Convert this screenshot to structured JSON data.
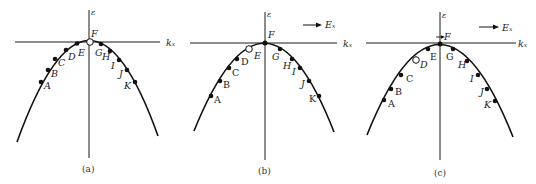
{
  "figure": {
    "panels": [
      {
        "id": "a",
        "caption": "(a)",
        "axis_y_label": "ε",
        "axis_x_label": "kₓ",
        "field_label": "",
        "empty_state": "F",
        "points": [
          {
            "label": "A",
            "x": 41,
            "y": 82,
            "filled": true
          },
          {
            "label": "B",
            "x": 48,
            "y": 70,
            "filled": true
          },
          {
            "label": "C",
            "x": 55,
            "y": 59,
            "filled": true
          },
          {
            "label": "D",
            "x": 66,
            "y": 50,
            "filled": true
          },
          {
            "label": "E",
            "x": 77,
            "y": 43.5,
            "filled": true
          },
          {
            "label": "F",
            "x": 90,
            "y": 42,
            "filled": false
          },
          {
            "label": "G",
            "x": 101,
            "y": 44,
            "filled": true
          },
          {
            "label": "H",
            "x": 110,
            "y": 51,
            "filled": true
          },
          {
            "label": "I",
            "x": 119,
            "y": 60,
            "filled": true
          },
          {
            "label": "J",
            "x": 127,
            "y": 70,
            "filled": true
          },
          {
            "label": "K",
            "x": 135,
            "y": 82,
            "filled": true
          }
        ]
      },
      {
        "id": "b",
        "caption": "(b)",
        "axis_y_label": "ε",
        "axis_x_label": "kₓ",
        "field_label": "Eₓ",
        "empty_state": "E",
        "points": [
          {
            "label": "A",
            "x": 211,
            "y": 96,
            "filled": true
          },
          {
            "label": "B",
            "x": 220,
            "y": 81,
            "filled": true
          },
          {
            "label": "C",
            "x": 229,
            "y": 68,
            "filled": true
          },
          {
            "label": "D",
            "x": 237,
            "y": 59,
            "filled": true
          },
          {
            "label": "E",
            "x": 249,
            "y": 49,
            "filled": false
          },
          {
            "label": "F",
            "x": 265,
            "y": 43,
            "filled": true
          },
          {
            "label": "G",
            "x": 280,
            "y": 49,
            "filled": true
          },
          {
            "label": "H",
            "x": 292,
            "y": 59,
            "filled": true
          },
          {
            "label": "I",
            "x": 300,
            "y": 68,
            "filled": true
          },
          {
            "label": "J",
            "x": 309,
            "y": 81,
            "filled": true
          },
          {
            "label": "K",
            "x": 319,
            "y": 96,
            "filled": true
          }
        ]
      },
      {
        "id": "c",
        "caption": "(c)",
        "axis_y_label": "ε",
        "axis_x_label": "kₓ",
        "field_label": "Eₓ",
        "empty_state": "D",
        "points": [
          {
            "label": "A",
            "x": 384,
            "y": 100,
            "filled": true
          },
          {
            "label": "B",
            "x": 391,
            "y": 89,
            "filled": true
          },
          {
            "label": "C",
            "x": 401,
            "y": 75,
            "filled": true
          },
          {
            "label": "D",
            "x": 416,
            "y": 60,
            "filled": false
          },
          {
            "label": "E",
            "x": 428,
            "y": 49,
            "filled": true
          },
          {
            "label": "F",
            "x": 440,
            "y": 44,
            "filled": true
          },
          {
            "label": "G",
            "x": 453,
            "y": 49,
            "filled": true
          },
          {
            "label": "H",
            "x": 467,
            "y": 61,
            "filled": true
          },
          {
            "label": "I",
            "x": 478,
            "y": 75,
            "filled": true
          },
          {
            "label": "J",
            "x": 487,
            "y": 89,
            "filled": true
          },
          {
            "label": "K",
            "x": 495,
            "y": 101,
            "filled": true
          }
        ]
      }
    ]
  }
}
